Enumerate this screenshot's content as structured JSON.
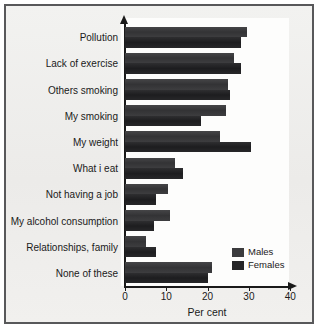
{
  "chart_data": {
    "type": "bar",
    "orientation": "horizontal",
    "title": "",
    "xlabel": "Per cent",
    "ylabel": "",
    "xlim": [
      0,
      42
    ],
    "xticks": [
      0,
      10,
      20,
      30,
      40
    ],
    "xtick_labels": [
      "0",
      "10",
      "20",
      "30",
      "40"
    ],
    "grid": false,
    "legend_position": "bottom-right",
    "categories": [
      "Pollution",
      "Lack of exercise",
      "Others smoking",
      "My smoking",
      "My weight",
      "What i eat",
      "Not having a job",
      "My alcohol consumption",
      "Relationships, family",
      "None of these"
    ],
    "series": [
      {
        "name": "Males",
        "color": "#3b3b3d",
        "values": [
          29.5,
          26.5,
          25,
          24.5,
          23,
          12,
          10.5,
          11,
          5,
          21
        ]
      },
      {
        "name": "Females",
        "color": "#252527",
        "values": [
          28,
          28,
          25.5,
          18.5,
          30.5,
          14,
          7.5,
          7,
          7.5,
          20
        ]
      }
    ]
  },
  "legend": {
    "items": [
      {
        "label": "Males",
        "key": "males"
      },
      {
        "label": "Females",
        "key": "females"
      }
    ]
  }
}
